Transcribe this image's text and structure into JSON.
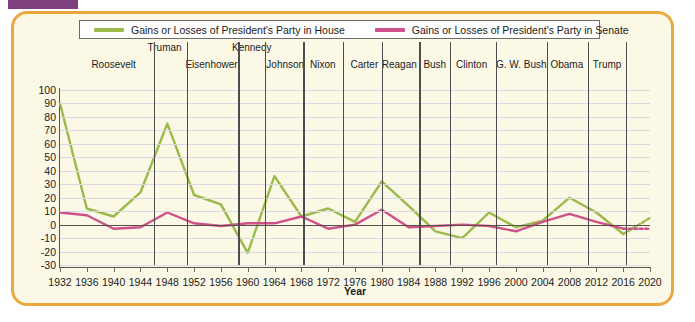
{
  "figure": {
    "border_color": "#eaa83f",
    "background_color": "#fbf8e6",
    "tab_color": "#7d3f7d"
  },
  "legend": {
    "items": [
      {
        "label": "Gains or Losses of President's Party in House",
        "color": "#9aba4a",
        "name": "house"
      },
      {
        "label": "Gains or Losses of President's Party in Senate",
        "color": "#cf5189",
        "name": "senate"
      }
    ]
  },
  "presidents": [
    {
      "name": "Roosevelt",
      "label_x": 1940.0,
      "divider_year": 1946.0,
      "row": 1
    },
    {
      "name": "Truman",
      "label_x": 1947.6,
      "divider_year": 1950.9,
      "row": 0
    },
    {
      "name": "Eisenhower",
      "label_x": 1954.6,
      "divider_year": 1958.6,
      "row": 1
    },
    {
      "name": "Kennedy",
      "label_x": 1960.6,
      "divider_year": 1962.6,
      "row": 0
    },
    {
      "name": "Johnson",
      "label_x": 1965.6,
      "divider_year": 1968.3,
      "row": 1
    },
    {
      "name": "Nixon",
      "label_x": 1971.2,
      "divider_year": 1974.2,
      "row": 1
    },
    {
      "name": "Carter",
      "label_x": 1977.4,
      "divider_year": 1980.0,
      "row": 1
    },
    {
      "name": "Reagan",
      "label_x": 1982.6,
      "divider_year": 1985.6,
      "row": 1
    },
    {
      "name": "Bush",
      "label_x": 1987.9,
      "divider_year": 1990.2,
      "row": 1
    },
    {
      "name": "Clinton",
      "label_x": 1993.4,
      "divider_year": 1997.0,
      "row": 1
    },
    {
      "name": "G. W. Bush",
      "label_x": 2000.8,
      "divider_year": 2004.6,
      "row": 1
    },
    {
      "name": "Obama",
      "label_x": 2007.6,
      "divider_year": 2010.7,
      "row": 1
    },
    {
      "name": "Trump",
      "label_x": 2013.6,
      "divider_year": 2016.4,
      "row": 1
    }
  ],
  "chart_data": {
    "type": "line",
    "title": "",
    "xlabel": "Year",
    "ylabel": "",
    "grid": true,
    "legend_position": "top",
    "xlim": [
      1932,
      2020
    ],
    "ylim": [
      -30,
      100
    ],
    "ytick_step": 10,
    "yticks": [
      100,
      90,
      80,
      70,
      60,
      50,
      40,
      30,
      20,
      10,
      0,
      -10,
      -20,
      -30
    ],
    "categories": [
      1932,
      1936,
      1940,
      1944,
      1948,
      1952,
      1956,
      1960,
      1964,
      1968,
      1972,
      1976,
      1980,
      1984,
      1988,
      1992,
      1996,
      2000,
      2004,
      2008,
      2012,
      2016,
      2020
    ],
    "xticklabels": [
      "1932",
      "1936",
      "1940",
      "1944",
      "1948",
      "1952",
      "1956",
      "1960",
      "1964",
      "1968",
      "1972",
      "1976",
      "1980",
      "1984",
      "1988",
      "1992",
      "1996",
      "2000",
      "2004",
      "2008",
      "2012",
      "2016",
      "2020"
    ],
    "series": [
      {
        "name": "Gains or Losses of President's Party in House",
        "color": "#9aba4a",
        "values": [
          90,
          12,
          6,
          24,
          75,
          22,
          15,
          -21,
          36,
          6,
          12,
          2,
          32,
          14,
          -5,
          -10,
          9,
          -2,
          3,
          20,
          9,
          -7,
          5
        ],
        "dashed_from": 2016
      },
      {
        "name": "Gains or Losses of President's Party in Senate",
        "color": "#cf5189",
        "values": [
          9,
          7,
          -3,
          -2,
          9,
          1,
          -1,
          1,
          1,
          6,
          -3,
          0,
          11,
          -2,
          -1,
          0,
          -1,
          -5,
          2,
          8,
          2,
          -3,
          -3
        ],
        "dashed_from": 2016
      }
    ]
  }
}
